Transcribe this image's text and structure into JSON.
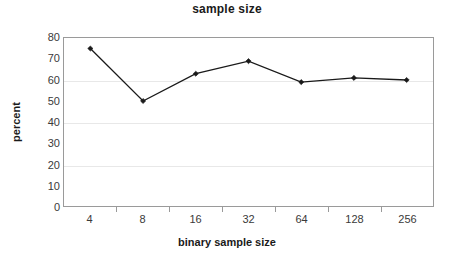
{
  "chart_data": {
    "type": "line",
    "title": "sample size",
    "xlabel": "binary sample size",
    "ylabel": "percent",
    "categories": [
      "4",
      "8",
      "16",
      "32",
      "64",
      "128",
      "256"
    ],
    "values": [
      75,
      50,
      63,
      69,
      59,
      61,
      60
    ],
    "series": [
      {
        "name": "percent",
        "values": [
          75,
          50,
          63,
          69,
          59,
          61,
          60
        ],
        "color": "#1a1a1a",
        "marker": "diamond"
      }
    ],
    "ylim": [
      0,
      80
    ],
    "ytick_labels": [
      "80",
      "70",
      "60",
      "50",
      "40",
      "30",
      "20",
      "10",
      "0"
    ],
    "ytick_values": [
      80,
      70,
      60,
      50,
      40,
      30,
      20,
      10,
      0
    ],
    "ytick_interval": 10,
    "grid": "horizontal-major",
    "gridline_values": [
      60,
      40,
      20
    ],
    "legend": "none",
    "legend_position": "none",
    "plot_border_color": "#9a9a9a",
    "gridline_color": "#e8e8e8",
    "background": "#ffffff"
  }
}
